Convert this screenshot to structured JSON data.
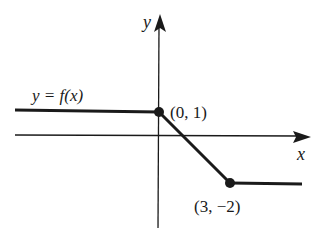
{
  "diagram": {
    "type": "piecewise-linear function graph",
    "axes": {
      "x_label": "x",
      "y_label": "y"
    },
    "function_label": "y = f(x)",
    "points": [
      {
        "label": "(0, 1)",
        "x": 0,
        "y": 1
      },
      {
        "label": "(3, −2)",
        "x": 3,
        "y": -2
      }
    ],
    "segments": [
      {
        "from": "-inf",
        "to": "(0, 1)",
        "kind": "horizontal",
        "y": 1
      },
      {
        "from": "(0, 1)",
        "to": "(3, −2)",
        "kind": "linear"
      },
      {
        "from": "(3, −2)",
        "to": "+inf",
        "kind": "horizontal",
        "y": -2
      }
    ],
    "colors": {
      "ink": "#1a1a1a",
      "background": "#ffffff"
    }
  }
}
